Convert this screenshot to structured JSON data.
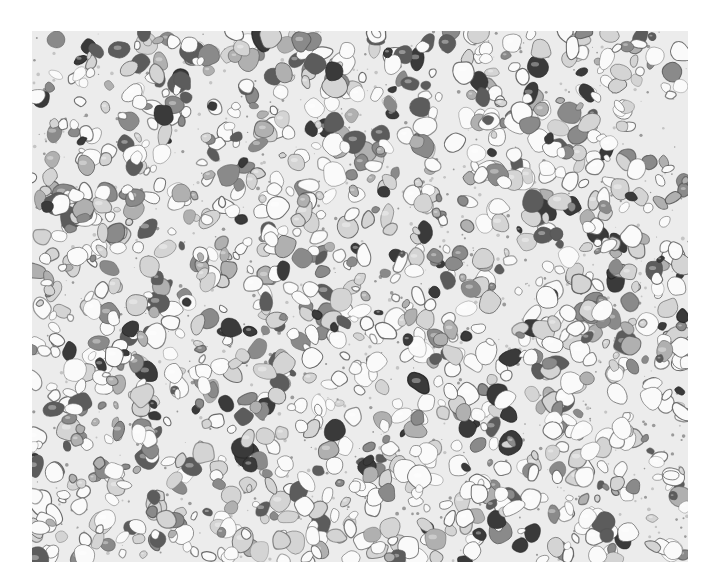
{
  "image": {
    "subject": "terrazzo aggregate texture",
    "style": "grayscale halftone photograph",
    "frame": {
      "x": 32,
      "y": 31,
      "width": 656,
      "height": 531
    },
    "palette": {
      "background": "#ffffff",
      "matrix": "#ececec",
      "white_stone": "#fafafa",
      "light_stone": "#d4d4d4",
      "mid_stone": "#8a8a8a",
      "dark_stone": "#3a3a3a",
      "outline": "#555555"
    },
    "stone_count": 1400,
    "seed": 1337
  },
  "caption": {
    "text": ""
  }
}
